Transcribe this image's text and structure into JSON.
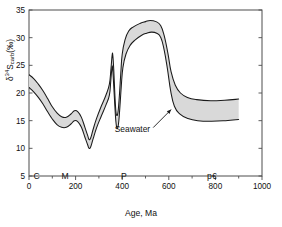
{
  "chart_data": {
    "type": "area",
    "title": "",
    "xlabel": "Age, Ma",
    "ylabel_plain": "d34Scarb(‰)",
    "ylabel_parts": {
      "delta": "δ",
      "iso": "34",
      "element": "S",
      "sub": "carb",
      "unit": "(‰)"
    },
    "xlim": [
      0,
      1000
    ],
    "ylim": [
      5,
      35
    ],
    "grid": false,
    "legend": "none",
    "xticks": [
      0,
      200,
      400,
      600,
      800,
      1000
    ],
    "xtick_labels": [
      "0",
      "200",
      "400",
      "600",
      "800",
      "1000"
    ],
    "xminor_ticks": [
      100,
      300,
      500,
      700,
      900
    ],
    "yticks": [
      5,
      10,
      15,
      20,
      25,
      30,
      35
    ],
    "ytick_labels": [
      "5",
      "10",
      "15",
      "20",
      "25",
      "30",
      "35"
    ],
    "annotations": [
      {
        "text": "Seawater",
        "x": 520,
        "y": 13.2,
        "arrow_to_x": 610,
        "arrow_to_y": 17.0
      }
    ],
    "era_bands": [
      {
        "label": "C",
        "start": 0,
        "end": 65
      },
      {
        "label": "M",
        "start": 65,
        "end": 245
      },
      {
        "label": "P",
        "start": 245,
        "end": 570
      },
      {
        "label": "p€",
        "start": 570,
        "end": 1000
      }
    ],
    "band_fill_color": "#d9d9d9",
    "band_edge_color": "#1a1a1a",
    "axis_color": "#4d4d4d",
    "series": [
      {
        "name": "seawater sulfate upper bound",
        "points": [
          [
            0,
            23.3
          ],
          [
            20,
            22.6
          ],
          [
            40,
            21.6
          ],
          [
            60,
            20.4
          ],
          [
            80,
            19.0
          ],
          [
            100,
            17.5
          ],
          [
            120,
            16.4
          ],
          [
            140,
            15.7
          ],
          [
            160,
            15.6
          ],
          [
            180,
            16.2
          ],
          [
            195,
            16.8
          ],
          [
            210,
            16.6
          ],
          [
            225,
            15.6
          ],
          [
            240,
            13.8
          ],
          [
            252,
            12.3
          ],
          [
            258,
            11.6
          ],
          [
            265,
            11.9
          ],
          [
            275,
            13.4
          ],
          [
            290,
            15.4
          ],
          [
            310,
            17.6
          ],
          [
            330,
            19.6
          ],
          [
            345,
            21.6
          ],
          [
            352,
            24.5
          ],
          [
            357,
            26.9
          ],
          [
            360,
            26.7
          ],
          [
            364,
            24.0
          ],
          [
            368,
            20.2
          ],
          [
            372,
            17.2
          ],
          [
            376,
            16.0
          ],
          [
            382,
            16.6
          ],
          [
            388,
            19.6
          ],
          [
            394,
            23.6
          ],
          [
            400,
            27.0
          ],
          [
            412,
            29.6
          ],
          [
            428,
            31.2
          ],
          [
            450,
            32.0
          ],
          [
            478,
            32.6
          ],
          [
            500,
            32.9
          ],
          [
            520,
            33.1
          ],
          [
            545,
            32.9
          ],
          [
            565,
            32.2
          ],
          [
            580,
            30.4
          ],
          [
            596,
            27.2
          ],
          [
            610,
            23.8
          ],
          [
            628,
            21.4
          ],
          [
            650,
            20.0
          ],
          [
            680,
            19.2
          ],
          [
            720,
            18.8
          ],
          [
            780,
            18.6
          ],
          [
            840,
            18.7
          ],
          [
            900,
            18.9
          ]
        ]
      },
      {
        "name": "seawater sulfate lower bound",
        "points": [
          [
            0,
            21.0
          ],
          [
            20,
            20.2
          ],
          [
            40,
            19.2
          ],
          [
            60,
            18.0
          ],
          [
            80,
            16.6
          ],
          [
            100,
            15.3
          ],
          [
            120,
            14.3
          ],
          [
            140,
            13.8
          ],
          [
            160,
            13.8
          ],
          [
            180,
            14.4
          ],
          [
            195,
            15.0
          ],
          [
            210,
            14.8
          ],
          [
            225,
            13.8
          ],
          [
            240,
            12.0
          ],
          [
            252,
            10.6
          ],
          [
            258,
            10.0
          ],
          [
            265,
            10.3
          ],
          [
            275,
            11.7
          ],
          [
            290,
            13.7
          ],
          [
            310,
            15.8
          ],
          [
            330,
            17.8
          ],
          [
            345,
            19.6
          ],
          [
            351,
            22.2
          ],
          [
            356,
            24.6
          ],
          [
            359,
            24.4
          ],
          [
            363,
            21.8
          ],
          [
            368,
            18.0
          ],
          [
            373,
            14.8
          ],
          [
            378,
            13.6
          ],
          [
            384,
            14.4
          ],
          [
            390,
            17.4
          ],
          [
            396,
            21.2
          ],
          [
            403,
            24.6
          ],
          [
            416,
            27.0
          ],
          [
            434,
            28.6
          ],
          [
            456,
            29.6
          ],
          [
            482,
            30.4
          ],
          [
            505,
            30.8
          ],
          [
            525,
            31.0
          ],
          [
            548,
            30.8
          ],
          [
            566,
            30.0
          ],
          [
            580,
            27.8
          ],
          [
            594,
            24.4
          ],
          [
            608,
            20.4
          ],
          [
            624,
            17.6
          ],
          [
            648,
            16.2
          ],
          [
            682,
            15.4
          ],
          [
            724,
            15.0
          ],
          [
            784,
            14.9
          ],
          [
            844,
            15.0
          ],
          [
            900,
            15.2
          ]
        ]
      }
    ]
  }
}
